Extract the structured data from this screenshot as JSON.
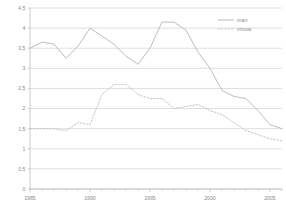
{
  "chart_data": {
    "type": "line",
    "title": "",
    "subtitle": "",
    "xlabel": "",
    "ylabel": "",
    "xlim": [
      1985,
      2006
    ],
    "ylim": [
      0,
      4.5
    ],
    "grid": true,
    "legend_position": "top-right",
    "x": [
      1985,
      1986,
      1987,
      1988,
      1989,
      1990,
      1991,
      1992,
      1993,
      1994,
      1995,
      1996,
      1997,
      1998,
      1999,
      2000,
      2001,
      2002,
      2003,
      2004,
      2005,
      2006
    ],
    "x_tick_labels": [
      "1985",
      "1990",
      "1995",
      "2000",
      "2005"
    ],
    "x_tick_values": [
      1985,
      1990,
      1995,
      2000,
      2005
    ],
    "y_tick_labels": [
      "0",
      "0,5",
      "1",
      "1,5",
      "2",
      "2,5",
      "3",
      "3,5",
      "4",
      "4,5"
    ],
    "y_tick_values": [
      0,
      0.5,
      1,
      1.5,
      2,
      2.5,
      3,
      3.5,
      4,
      4.5
    ],
    "series": [
      {
        "name": "man",
        "style": "solid",
        "color": "#b9b9b9",
        "values": [
          3.5,
          3.65,
          3.6,
          3.25,
          3.55,
          4.0,
          3.8,
          3.6,
          3.3,
          3.1,
          3.5,
          4.15,
          4.15,
          3.95,
          3.4,
          3.0,
          2.45,
          2.3,
          2.25,
          1.95,
          1.6,
          1.5
        ]
      },
      {
        "name": "vrouw",
        "style": "dashed",
        "color": "#c2c2c2",
        "values": [
          1.5,
          1.5,
          1.5,
          1.45,
          1.65,
          1.6,
          2.35,
          2.6,
          2.6,
          2.35,
          2.25,
          2.25,
          2.0,
          2.05,
          2.1,
          1.95,
          1.85,
          1.65,
          1.45,
          1.35,
          1.25,
          1.2
        ]
      }
    ]
  },
  "legend": {
    "items": [
      {
        "label": "man"
      },
      {
        "label": "vrouw"
      }
    ]
  }
}
